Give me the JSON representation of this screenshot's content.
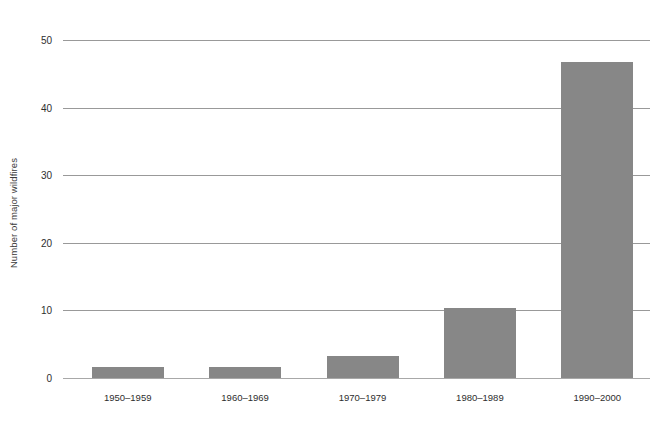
{
  "chart_data": {
    "type": "bar",
    "title": "",
    "subtitle": "",
    "xlabel": "",
    "ylabel": "Number of major wildfires",
    "categories": [
      "1950–1959",
      "1960–1969",
      "1970–1979",
      "1980–1989",
      "1990–2000"
    ],
    "values": [
      1.6,
      1.6,
      3.2,
      10.3,
      46.8
    ],
    "series": [
      {
        "name": "Number of major wildfires",
        "values": [
          1.6,
          1.6,
          3.2,
          10.3,
          46.8
        ]
      }
    ],
    "ylim": [
      0,
      50
    ],
    "yticks": [
      0,
      10,
      20,
      30,
      40,
      50
    ],
    "ytick_labels": [
      "0",
      "10",
      "20",
      "30",
      "40",
      "50"
    ],
    "xtick_labels": [
      "1950–1959",
      "1960–1969",
      "1970–1979",
      "1980–1989",
      "1990–2000"
    ],
    "grid": true,
    "grid_axis": "y",
    "legend": false,
    "legend_position": "none",
    "bar_color": "#878787",
    "gridline_color": "#999999",
    "text_color": "#2e2e2e",
    "background_color": "#ffffff"
  }
}
